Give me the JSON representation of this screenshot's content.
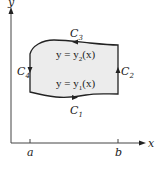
{
  "figure": {
    "axes": {
      "x_label": "x",
      "y_label": "y",
      "ticks": [
        {
          "label": "a",
          "position": "left bound"
        },
        {
          "label": "b",
          "position": "right bound"
        }
      ]
    },
    "region": {
      "fill_color": "#ececec",
      "upper_curve": {
        "eq_prefix": "y = y",
        "eq_sub": "2",
        "eq_suffix": "(x)"
      },
      "lower_curve": {
        "eq_prefix": "y = y",
        "eq_sub": "1",
        "eq_suffix": "(x)"
      }
    },
    "curves": [
      {
        "name": "C",
        "sub": "1",
        "side": "bottom",
        "direction": "right"
      },
      {
        "name": "C",
        "sub": "2",
        "side": "right",
        "direction": "up"
      },
      {
        "name": "C",
        "sub": "3",
        "side": "top",
        "direction": "left"
      },
      {
        "name": "C",
        "sub": "4",
        "side": "left",
        "direction": "down"
      }
    ]
  }
}
